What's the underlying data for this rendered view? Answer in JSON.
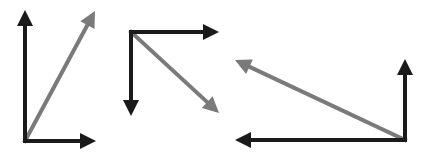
{
  "colors": {
    "background": "#ffffff",
    "component": "#1a1a1a",
    "resultant": "#7a7a7a"
  },
  "stroke_width": 4,
  "head": {
    "length": 16,
    "half_width": 8
  },
  "diagrams": [
    {
      "name": "diagram-up-right",
      "origin": [
        25,
        141
      ],
      "vectors": [
        {
          "name": "vertical-component-up",
          "kind": "component",
          "to": [
            25,
            10
          ]
        },
        {
          "name": "horizontal-component-right",
          "kind": "component",
          "to": [
            96,
            141
          ]
        },
        {
          "name": "resultant-up-right",
          "kind": "resultant",
          "to": [
            95,
            11
          ]
        }
      ]
    },
    {
      "name": "diagram-down-right",
      "origin": [
        131,
        32
      ],
      "vectors": [
        {
          "name": "horizontal-component-right",
          "kind": "component",
          "to": [
            219,
            32
          ]
        },
        {
          "name": "vertical-component-down",
          "kind": "component",
          "to": [
            131,
            116
          ]
        },
        {
          "name": "resultant-down-right",
          "kind": "resultant",
          "to": [
            219,
            113
          ]
        }
      ]
    },
    {
      "name": "diagram-up-left",
      "origin": [
        405,
        140
      ],
      "vectors": [
        {
          "name": "vertical-component-up",
          "kind": "component",
          "to": [
            405,
            59
          ]
        },
        {
          "name": "horizontal-component-left",
          "kind": "component",
          "to": [
            235,
            140
          ]
        },
        {
          "name": "resultant-up-left",
          "kind": "resultant",
          "to": [
            235,
            60
          ]
        }
      ]
    }
  ]
}
